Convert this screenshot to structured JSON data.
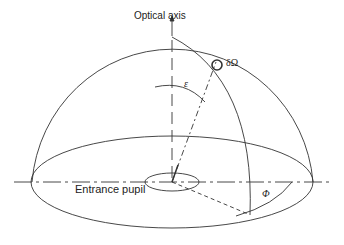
{
  "diagram": {
    "labels": {
      "optical_axis": "Optical axis",
      "solid_angle": "δΩ",
      "epsilon": "ε",
      "phi": "Φ",
      "entrance_pupil": "Entrance pupil"
    },
    "colors": {
      "stroke": "#333333",
      "background": "#ffffff"
    }
  }
}
